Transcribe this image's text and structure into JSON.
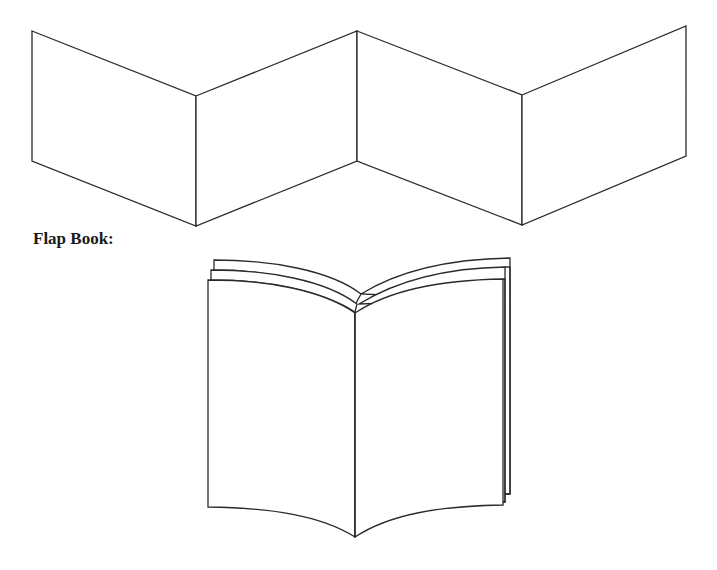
{
  "figures": {
    "accordion_book": {
      "panel_count": 4
    },
    "flap_book": {
      "label": "Flap Book:",
      "stacked_pages": 3
    }
  }
}
